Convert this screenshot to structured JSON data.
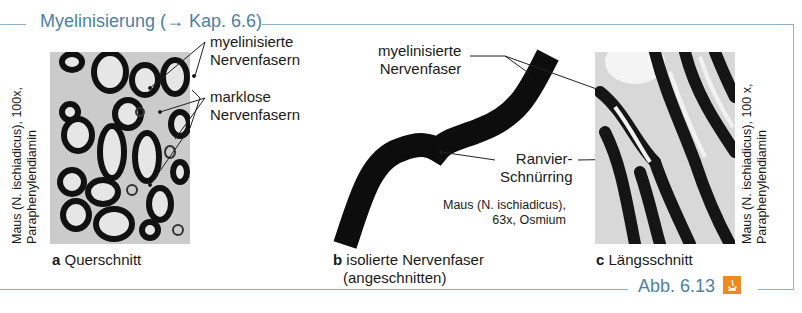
{
  "figure": {
    "title": "Myelinisierung (→ Kap. 6.6)",
    "figure_number": "Abb. 6.13",
    "icon": "microscope-icon",
    "accent_color": "#4d7fa6",
    "icon_color": "#f08a1f",
    "frame_color": "#8fb0c9"
  },
  "panel_a": {
    "letter": "a",
    "caption": "Querschnitt",
    "stain_line1": "Maus (N. ischiadicus), 100x,",
    "stain_line2": "Paraphenylendiamin",
    "labels": [
      {
        "line1": "myelinisierte",
        "line2": "Nervenfasern"
      },
      {
        "line1": "marklose",
        "line2": "Nervenfasern"
      }
    ]
  },
  "panel_b": {
    "letter": "b",
    "caption_line1": "isolierte Nervenfaser",
    "caption_line2": "(angeschnitten)",
    "label_fiber_line1": "myelinisierte",
    "label_fiber_line2": "Nervenfaser",
    "label_node_line1": "Ranvier-",
    "label_node_line2": "Schnürring",
    "stain_line1": "Maus (N. ischiadicus),",
    "stain_line2": "63x, Osmium"
  },
  "panel_c": {
    "letter": "c",
    "caption": "Längsschnitt",
    "stain_line1": "Maus (N. ischiadicus), 100 x,",
    "stain_line2": "Paraphenylendiamin"
  }
}
